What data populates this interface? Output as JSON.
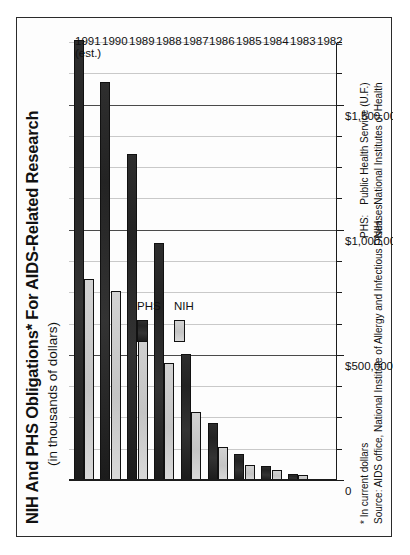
{
  "chart_data": {
    "type": "bar",
    "orientation": "horizontal",
    "stacked": false,
    "title": "NIH And PHS Obligations* For AIDS-Related Research",
    "subtitle": "(in thousands of dollars)",
    "xlabel": "",
    "ylabel": "",
    "categories": [
      "1982",
      "1983",
      "1984",
      "1985",
      "1986",
      "1987",
      "1988",
      "1989",
      "1990",
      "1991"
    ],
    "category_annotations": {
      "1991": "(est.)"
    },
    "series": [
      {
        "name": "PHS",
        "color": "#262626",
        "values": [
          5500,
          28000,
          61000,
          109000,
          233000,
          507000,
          951000,
          1305000,
          1593000,
          1760000
        ]
      },
      {
        "name": "NIH",
        "color": "#cfcfcf",
        "values": [
          3300,
          22000,
          44000,
          63000,
          134000,
          275000,
          472000,
          608000,
          760000,
          806000
        ]
      }
    ],
    "value_axis": {
      "ticks": [
        "0",
        "$500,000",
        "$1,000,000",
        "$1,500,000"
      ],
      "tick_values": [
        0,
        500000,
        1000000,
        1500000
      ],
      "limits": [
        0,
        1750000
      ],
      "minor_tick_step": 125000,
      "grid": true
    },
    "legend": {
      "position": "inside-left",
      "entries": [
        "PHS",
        "NIH"
      ]
    },
    "footnotes": [
      "*  In current dollars",
      "Source:  AIDS office, National Institute of Allergy and Infectious Diseases"
    ],
    "abbreviations": [
      {
        "key": "PHS:",
        "definition": "Public Health Service (U.F.)"
      },
      {
        "key": "NIH:",
        "definition": "National Institutes of Health"
      }
    ]
  },
  "page": {
    "border_color": "#2b2b2b",
    "background": "#ffffff"
  }
}
